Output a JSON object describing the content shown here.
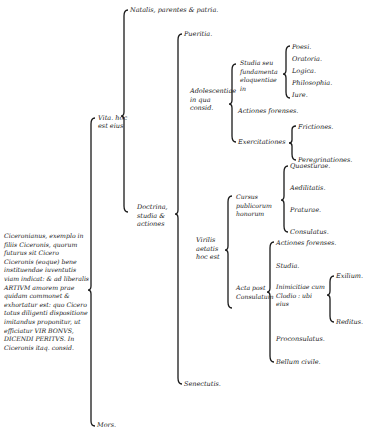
{
  "root": {
    "text": "Ciceronianus, exemplo in filiis Ciceronis, quorum futurus sit Cicero Ciceronis (eoque) bene instituendae iuventutis viam indicat: & ad liberalis ARTIVM amorem prae quidam commonet & exhortatur est: quo Cicero totus diligenti dispositione imitandus proponitur, ut efficiatur VIR BONVS, DICENDI PERITVS. In Ciceronis itaq. consid."
  },
  "level1": {
    "vita": "Vita. hoc est eius",
    "mors": "Mors."
  },
  "level2": {
    "natalis": "Natalis, parentes & patria.",
    "doctrina": "Doctrina, studia & actiones"
  },
  "level3": {
    "pueritia": "Pueritia.",
    "adolescentia": "Adolescentiae in qua consid.",
    "virilis": "Virilis aetatis hoc est",
    "senectus": "Senectutis."
  },
  "adolescentia": {
    "studia": "Studia seu fundamenta eloquentiae in",
    "studia_items": [
      "Poesi.",
      "Oratoria.",
      "Logica.",
      "Philosophia.",
      "Iure."
    ],
    "actiones": "Actiones forenses.",
    "exercitationes": "Exercitationes",
    "exercitationes_items": [
      "Frictiones.",
      "Peregrinationes."
    ]
  },
  "virilis": {
    "cursus": "Cursus publicorum honorum",
    "cursus_items": [
      "Quaesturae.",
      "Aedilitatis.",
      "Praturae.",
      "Consulatus."
    ],
    "acta": "Acta post Consulatum",
    "acta_items": [
      "Actiones forenses.",
      "Studia.",
      "Inimicitiae cum Clodio : ubi eius",
      "Proconsulatus.",
      "Bellum civile."
    ],
    "inimicitiae_items": [
      "Exilium.",
      "Reditus."
    ]
  }
}
